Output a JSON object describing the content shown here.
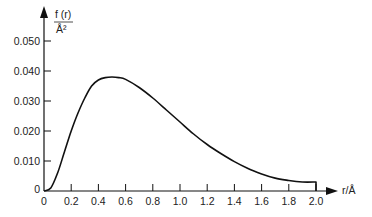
{
  "chart_data": {
    "type": "line",
    "title": "",
    "xlabel": "r/Å",
    "ylabel_numerator": "f (r)",
    "ylabel_denominator": "Å²",
    "xlim": [
      0,
      2.0
    ],
    "ylim": [
      0,
      0.055
    ],
    "grid": false,
    "legend": null,
    "x_ticks": [
      "0",
      "0.2",
      "0.4",
      "0.6",
      "0.8",
      "1.0",
      "1.2",
      "1.4",
      "1.6",
      "1.8",
      "2.0"
    ],
    "y_ticks": [
      "0",
      "0.010",
      "0.020",
      "0.030",
      "0.040",
      "0.050"
    ],
    "series": [
      {
        "name": "f(r)",
        "x": [
          0,
          0.05,
          0.1,
          0.15,
          0.2,
          0.25,
          0.3,
          0.35,
          0.4,
          0.45,
          0.5,
          0.55,
          0.6,
          0.7,
          0.8,
          0.9,
          1.0,
          1.1,
          1.2,
          1.3,
          1.4,
          1.5,
          1.6,
          1.7,
          1.8,
          1.9,
          2.0
        ],
        "values": [
          0,
          0.001,
          0.006,
          0.013,
          0.02,
          0.026,
          0.031,
          0.035,
          0.037,
          0.0378,
          0.038,
          0.0378,
          0.0372,
          0.0345,
          0.031,
          0.027,
          0.023,
          0.019,
          0.0155,
          0.0125,
          0.0098,
          0.0075,
          0.0057,
          0.0043,
          0.0035,
          0.003,
          0.003
        ]
      }
    ]
  }
}
